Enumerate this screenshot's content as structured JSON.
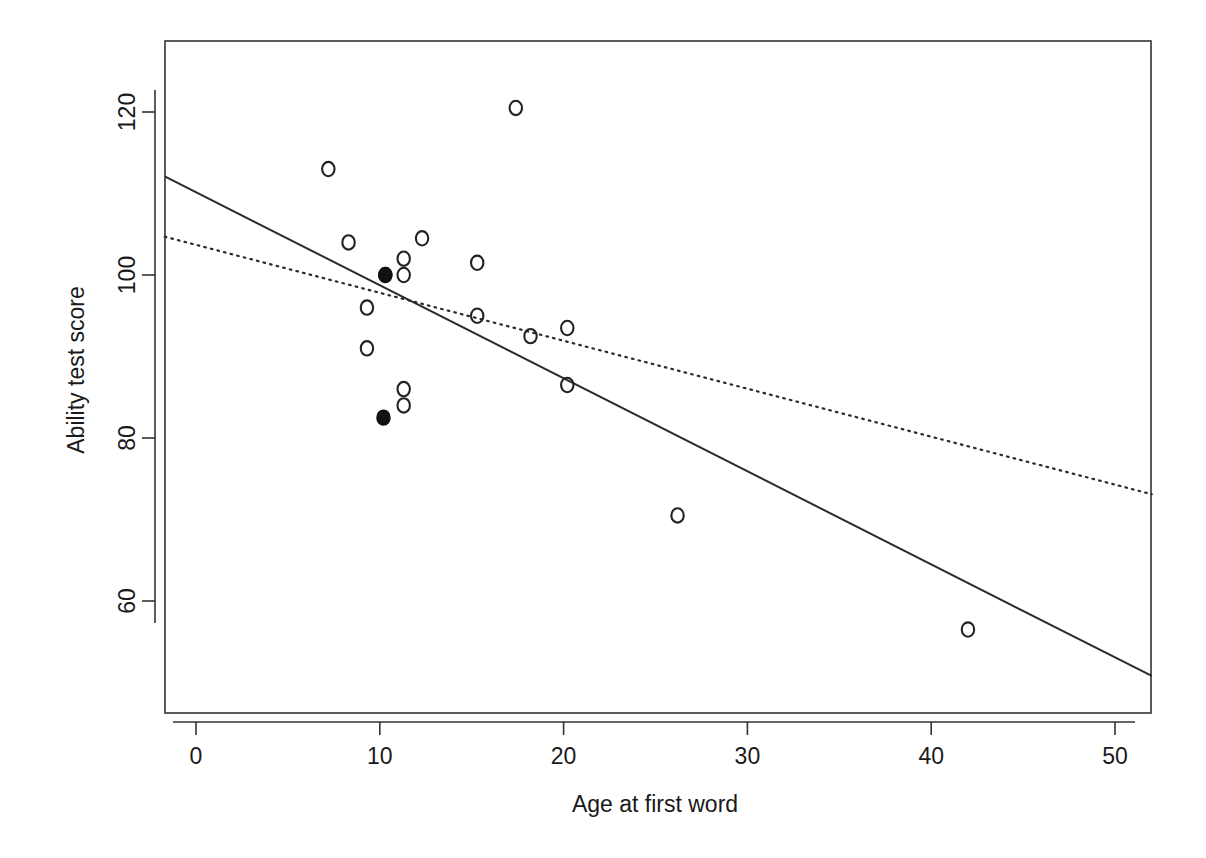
{
  "figure": {
    "background_color": "#ffffff",
    "foreground_color": "#1a1a1a",
    "width": 1206,
    "height": 858
  },
  "axis": {
    "x_title": "Age at first word",
    "y_title": "Ability test score",
    "x_ticks": [
      "0",
      "10",
      "20",
      "30",
      "40",
      "50"
    ],
    "y_ticks": [
      "60",
      "80",
      "100",
      "120"
    ]
  },
  "chart_data": {
    "type": "scatter",
    "title": "",
    "subtitle": "",
    "xlabel": "Age at first word",
    "ylabel": "Ability test score",
    "xlim": [
      -2,
      52
    ],
    "ylim": [
      49,
      128
    ],
    "xticks": [
      0,
      10,
      20,
      30,
      40,
      50
    ],
    "yticks": [
      60,
      80,
      100,
      120
    ],
    "grid": false,
    "legend": null,
    "legend_position": "none",
    "annotations": [],
    "series": [
      {
        "name": "Children (open circles)",
        "marker": "open-circle",
        "marker_color": "#222222",
        "points": [
          {
            "x": 7.2,
            "y": 113.0
          },
          {
            "x": 8.3,
            "y": 104.0
          },
          {
            "x": 9.3,
            "y": 96.0
          },
          {
            "x": 9.3,
            "y": 91.0
          },
          {
            "x": 10.3,
            "y": 100.0
          },
          {
            "x": 11.3,
            "y": 102.0
          },
          {
            "x": 11.3,
            "y": 100.0
          },
          {
            "x": 11.3,
            "y": 86.0
          },
          {
            "x": 11.3,
            "y": 84.0
          },
          {
            "x": 12.3,
            "y": 104.5
          },
          {
            "x": 15.3,
            "y": 101.5
          },
          {
            "x": 15.3,
            "y": 95.0
          },
          {
            "x": 17.4,
            "y": 120.5
          },
          {
            "x": 18.2,
            "y": 92.5
          },
          {
            "x": 20.2,
            "y": 93.5
          },
          {
            "x": 20.2,
            "y": 86.5
          },
          {
            "x": 26.2,
            "y": 70.5
          },
          {
            "x": 42.0,
            "y": 56.5
          }
        ]
      },
      {
        "name": "Influential cases (filled circles)",
        "marker": "filled-circle",
        "marker_color": "#111111",
        "points": [
          {
            "x": 10.3,
            "y": 100.0
          },
          {
            "x": 10.2,
            "y": 82.5
          }
        ]
      }
    ],
    "lines": [
      {
        "name": "Least-squares fit (all data)",
        "style": "solid",
        "color": "#2b2b2b",
        "x": [
          -1.7,
          52.0
        ],
        "y": [
          112.1,
          50.8
        ]
      },
      {
        "name": "Fit excluding influential cases",
        "style": "dotted",
        "color": "#2b2b2b",
        "x": [
          -1.7,
          52.0
        ],
        "y": [
          104.7,
          73.1
        ]
      }
    ]
  }
}
